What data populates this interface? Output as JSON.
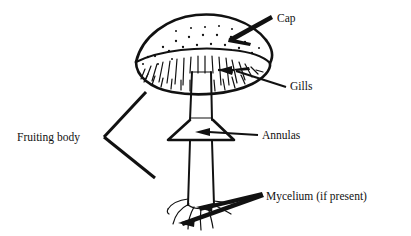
{
  "figure": {
    "style": "black-and-white line drawing",
    "background_color": "#ffffff",
    "ink_color": "#111111"
  },
  "labels": {
    "cap": "Cap",
    "gills": "Gills",
    "annulas": "Annulas",
    "mycelium": "Mycelium (if present)",
    "fruiting_body": "Fruiting body"
  },
  "label_positions": {
    "cap": {
      "x": 277,
      "y": 22
    },
    "gills": {
      "x": 290,
      "y": 90
    },
    "annulas": {
      "x": 262,
      "y": 139
    },
    "mycelium": {
      "x": 266,
      "y": 200
    },
    "fruiting_body": {
      "x": 17,
      "y": 141
    }
  },
  "parts": [
    {
      "name": "cap",
      "label": "Cap",
      "description": "domed pileus with scattered warts"
    },
    {
      "name": "gills",
      "label": "Gills",
      "description": "radiating lamellae under the cap"
    },
    {
      "name": "annulas",
      "label": "Annulas",
      "description": "skirt-like ring on the stipe"
    },
    {
      "name": "stipe",
      "label": "",
      "description": "vertical stem"
    },
    {
      "name": "mycelium",
      "label": "Mycelium (if present)",
      "description": "thread-like hyphae at the stem base"
    },
    {
      "name": "fruiting_body",
      "label": "Fruiting body",
      "description": "bracket grouping cap, gills and stipe"
    }
  ]
}
